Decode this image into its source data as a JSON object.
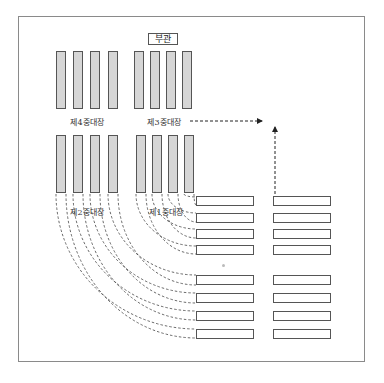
{
  "diagram": {
    "headquarters": {
      "label": "부관"
    },
    "companies": [
      {
        "id": "4",
        "label": "제4중대장",
        "position": "top-left",
        "bars": 4
      },
      {
        "id": "3",
        "label": "제3중대장",
        "position": "top-right",
        "bars": 4
      },
      {
        "id": "2",
        "label": "제2중대장",
        "position": "bottom-left",
        "bars": 4
      },
      {
        "id": "1",
        "label": "제1중대장",
        "position": "bottom-right",
        "bars": 4
      }
    ],
    "formation_rows": {
      "left_column": 8,
      "right_column": 8
    },
    "arrows": [
      {
        "direction": "right",
        "style": "dashed"
      },
      {
        "direction": "up",
        "style": "dashed"
      }
    ],
    "colors": {
      "bar_fill": "#d6d6d6",
      "stroke": "#555555",
      "frame": "#8a8a8a"
    }
  }
}
